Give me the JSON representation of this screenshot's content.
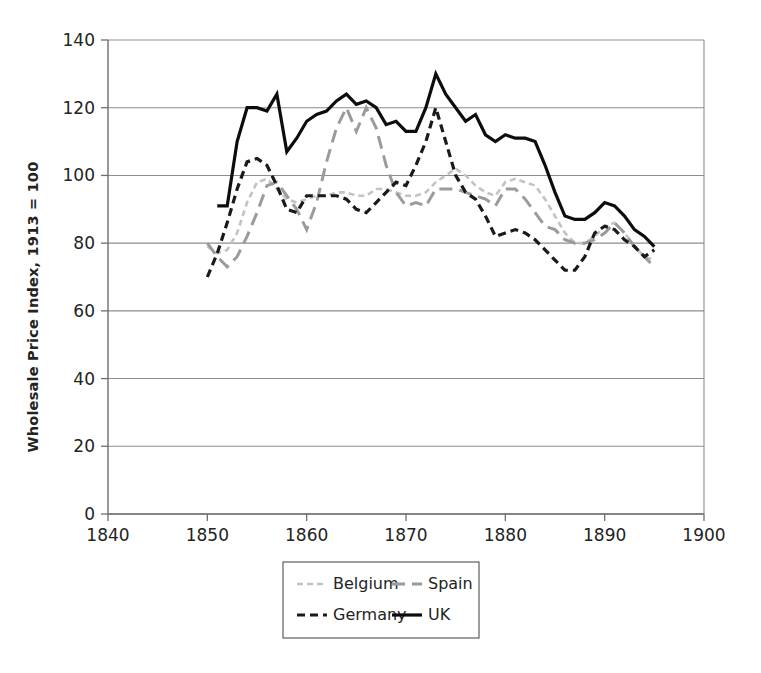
{
  "chart_data": {
    "type": "line",
    "title": "",
    "xlabel": "",
    "ylabel": "Wholesale Price Index, 1913 = 100",
    "xlim": [
      1840,
      1900
    ],
    "ylim": [
      0,
      140
    ],
    "xticks": [
      1840,
      1850,
      1860,
      1870,
      1880,
      1890,
      1900
    ],
    "yticks": [
      0,
      20,
      40,
      60,
      80,
      100,
      120,
      140
    ],
    "grid": "horizontal",
    "legend_position": "bottom",
    "series": [
      {
        "name": "Belgium",
        "color": "#c3c3c3",
        "dash": "6,4",
        "width": 2.6,
        "x": [
          1850,
          1851,
          1852,
          1853,
          1854,
          1855,
          1856,
          1857,
          1858,
          1859,
          1860,
          1861,
          1862,
          1863,
          1864,
          1865,
          1866,
          1867,
          1868,
          1869,
          1870,
          1871,
          1872,
          1873,
          1874,
          1875,
          1876,
          1877,
          1878,
          1879,
          1880,
          1881,
          1882,
          1883,
          1884,
          1885,
          1886,
          1887,
          1888,
          1889,
          1890,
          1891,
          1892,
          1893,
          1894,
          1895
        ],
        "values": [
          79,
          77,
          78,
          83,
          92,
          98,
          99,
          96,
          93,
          92,
          93,
          94,
          94,
          95,
          95,
          94,
          94,
          96,
          96,
          95,
          94,
          94,
          95,
          98,
          100,
          102,
          100,
          97,
          95,
          94,
          98,
          99,
          98,
          97,
          93,
          88,
          83,
          80,
          80,
          82,
          85,
          86,
          83,
          79,
          76,
          75
        ]
      },
      {
        "name": "Spain",
        "color": "#9b9b9b",
        "dash": "13,7",
        "width": 3.0,
        "x": [
          1850,
          1851,
          1852,
          1853,
          1854,
          1855,
          1856,
          1857,
          1858,
          1859,
          1860,
          1861,
          1862,
          1863,
          1864,
          1865,
          1866,
          1867,
          1868,
          1869,
          1870,
          1871,
          1872,
          1873,
          1874,
          1875,
          1876,
          1877,
          1878,
          1879,
          1880,
          1881,
          1882,
          1883,
          1884,
          1885,
          1886,
          1887,
          1888,
          1889,
          1890,
          1891,
          1892,
          1893,
          1894,
          1895
        ],
        "values": [
          80,
          76,
          73,
          76,
          82,
          89,
          97,
          98,
          94,
          90,
          84,
          92,
          104,
          114,
          120,
          113,
          120,
          114,
          103,
          95,
          91,
          92,
          91,
          96,
          96,
          96,
          95,
          94,
          93,
          91,
          96,
          96,
          93,
          89,
          85,
          84,
          81,
          80,
          80,
          81,
          83,
          86,
          83,
          79,
          76,
          73
        ]
      },
      {
        "name": "Germany",
        "color": "#1a1a1a",
        "dash": "8,5",
        "width": 3.2,
        "x": [
          1850,
          1851,
          1852,
          1853,
          1854,
          1855,
          1856,
          1857,
          1858,
          1859,
          1860,
          1861,
          1862,
          1863,
          1864,
          1865,
          1866,
          1867,
          1868,
          1869,
          1870,
          1871,
          1872,
          1873,
          1874,
          1875,
          1876,
          1877,
          1878,
          1879,
          1880,
          1881,
          1882,
          1883,
          1884,
          1885,
          1886,
          1887,
          1888,
          1889,
          1890,
          1891,
          1892,
          1893,
          1894,
          1895
        ],
        "values": [
          70,
          77,
          86,
          96,
          104,
          105,
          103,
          97,
          90,
          89,
          94,
          94,
          94,
          94,
          93,
          90,
          89,
          92,
          95,
          98,
          97,
          103,
          110,
          120,
          110,
          100,
          95,
          93,
          88,
          82,
          83,
          84,
          83,
          81,
          78,
          75,
          72,
          72,
          76,
          83,
          85,
          84,
          81,
          79,
          76,
          78
        ]
      },
      {
        "name": "UK",
        "color": "#0d0d0d",
        "dash": "none",
        "width": 3.2,
        "x": [
          1851,
          1852,
          1853,
          1854,
          1855,
          1856,
          1857,
          1858,
          1859,
          1860,
          1861,
          1862,
          1863,
          1864,
          1865,
          1866,
          1867,
          1868,
          1869,
          1870,
          1871,
          1872,
          1873,
          1874,
          1875,
          1876,
          1877,
          1878,
          1879,
          1880,
          1881,
          1882,
          1883,
          1884,
          1885,
          1886,
          1887,
          1888,
          1889,
          1890,
          1891,
          1892,
          1893,
          1894,
          1895
        ],
        "values": [
          91,
          91,
          110,
          120,
          120,
          119,
          124,
          107,
          111,
          116,
          118,
          119,
          122,
          124,
          121,
          122,
          120,
          115,
          116,
          113,
          113,
          120,
          130,
          124,
          120,
          116,
          118,
          112,
          110,
          112,
          111,
          111,
          110,
          103,
          95,
          88,
          87,
          87,
          89,
          92,
          91,
          88,
          84,
          82,
          79
        ]
      }
    ]
  },
  "legend": {
    "entries": [
      {
        "label": "Belgium"
      },
      {
        "label": "Spain"
      },
      {
        "label": "Germany"
      },
      {
        "label": "UK"
      }
    ]
  },
  "axes": {
    "y_title": "Wholesale Price Index, 1913 = 100",
    "y_tick_labels": [
      "140",
      "120",
      "100",
      "80",
      "60",
      "40",
      "20",
      "0"
    ],
    "x_tick_labels": [
      "1840",
      "1850",
      "1860",
      "1870",
      "1880",
      "1890",
      "1900"
    ]
  }
}
